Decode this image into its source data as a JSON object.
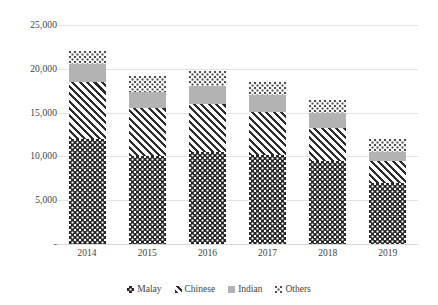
{
  "chart_data": {
    "type": "bar",
    "stacked": true,
    "title": "",
    "xlabel": "",
    "ylabel": "",
    "categories": [
      "2014",
      "2015",
      "2016",
      "2017",
      "2018",
      "2019"
    ],
    "series": [
      {
        "name": "Malay",
        "pattern": "dark-checker",
        "values": [
          12000,
          10000,
          10500,
          10200,
          9500,
          7000
        ]
      },
      {
        "name": "Chinese",
        "pattern": "diagonal-hatch",
        "values": [
          6500,
          5500,
          5500,
          4900,
          3800,
          2500
        ]
      },
      {
        "name": "Indian",
        "pattern": "solid-gray",
        "values": [
          2000,
          1900,
          2000,
          1900,
          1700,
          1000
        ]
      },
      {
        "name": "Others",
        "pattern": "light-dots",
        "values": [
          1500,
          1800,
          1700,
          1500,
          1400,
          1500
        ]
      }
    ],
    "totals": [
      22000,
      19200,
      19700,
      18500,
      16400,
      12000
    ],
    "ylim": [
      0,
      25000
    ],
    "yticks": [
      0,
      5000,
      10000,
      15000,
      20000,
      25000
    ],
    "ytick_labels": [
      "-",
      "5,000",
      "10,000",
      "15,000",
      "20,000",
      "25,000"
    ],
    "grid": true,
    "legend_position": "bottom"
  },
  "axis": {
    "y": {
      "ticks": [
        {
          "label": "25,000",
          "value": 25000
        },
        {
          "label": "20,000",
          "value": 20000
        },
        {
          "label": "15,000",
          "value": 15000
        },
        {
          "label": "10,000",
          "value": 10000
        },
        {
          "label": "5,000",
          "value": 5000
        },
        {
          "label": "-",
          "value": 0
        }
      ]
    },
    "x": {
      "labels": [
        "2014",
        "2015",
        "2016",
        "2017",
        "2018",
        "2019"
      ]
    }
  },
  "legend": {
    "items": [
      {
        "label": "Malay",
        "color": "#262626"
      },
      {
        "label": "Chinese",
        "color": "#2b2b2b"
      },
      {
        "label": "Indian",
        "color": "#b3b3b3"
      },
      {
        "label": "Others",
        "color": "#4d4d4d"
      }
    ]
  },
  "colors": {
    "grid": "#e3e3e3",
    "text": "#3f3f3f",
    "background": "#ffffff"
  }
}
